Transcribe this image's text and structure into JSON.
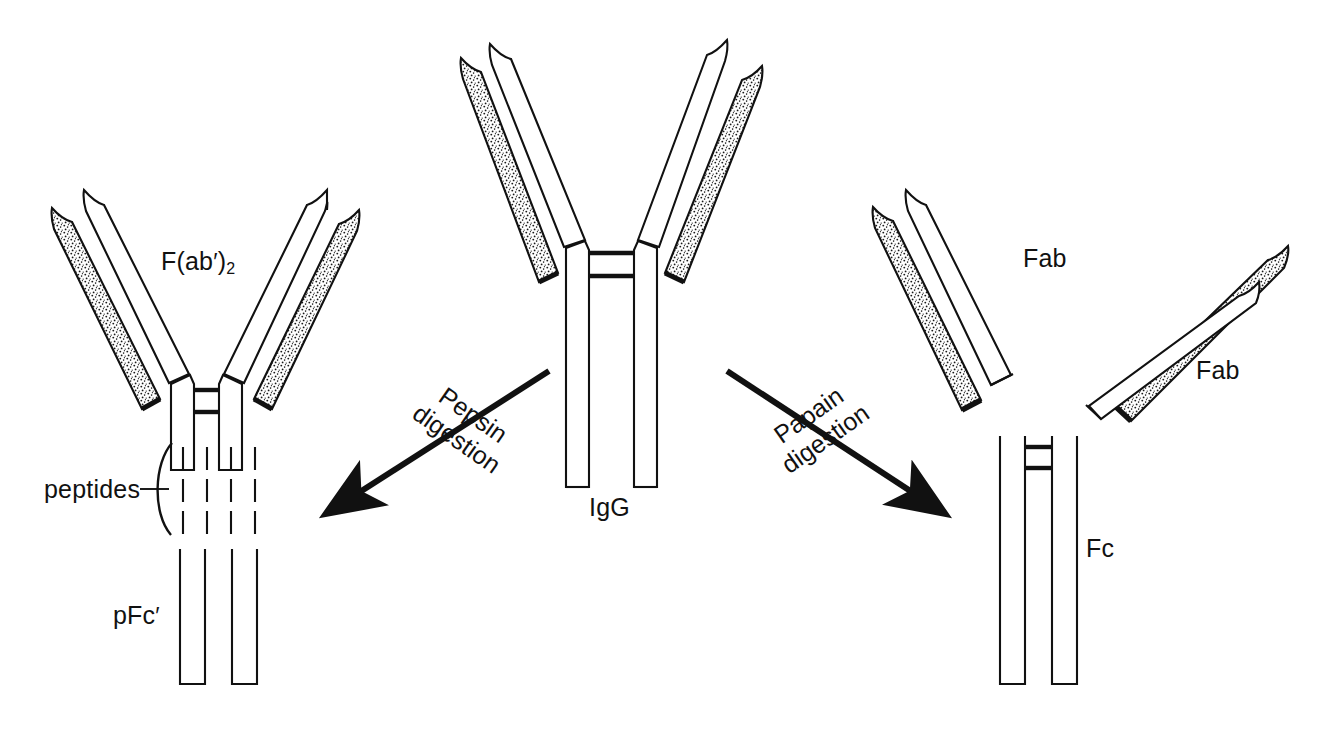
{
  "figure": {
    "background_color": "#ffffff",
    "ink_color": "#111111",
    "stipple_fill": "light-stipple-texture"
  },
  "center": {
    "molecule_label": "IgG",
    "description": "Intact immunoglobulin G, Y-shaped, two stippled light chains and two plain heavy chains joined at a hinge with two interchain disulfide bars"
  },
  "left_products": {
    "fab2_label": "F(ab",
    "fab2_prime": "′",
    "fab2_close": ")",
    "fab2_subscript": "2",
    "fab2_full": "F(ab′)2",
    "peptides_label": "peptides",
    "pfc_label": "pFc",
    "pfc_prime": "′",
    "pfc_full": "pFc′",
    "peptide_dash_columns": 4,
    "peptide_dash_rows": 3
  },
  "right_products": {
    "fab_label_1": "Fab",
    "fab_label_2": "Fab",
    "fc_label": "Fc"
  },
  "arrows": {
    "left": {
      "enzyme": "Pepsin",
      "action": "digestion",
      "direction": "down-left",
      "rotation_degrees": 35
    },
    "right": {
      "enzyme": "Papain",
      "action": "digestion",
      "direction": "down-right",
      "rotation_degrees": -35
    }
  }
}
